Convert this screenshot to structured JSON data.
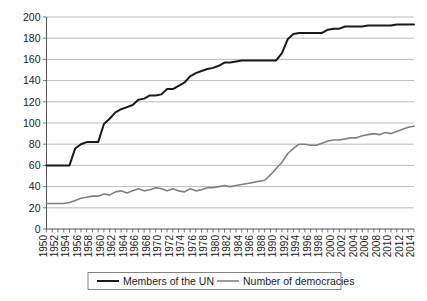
{
  "chart_data": {
    "type": "line",
    "title": "",
    "subtitle": "",
    "xlabel": "",
    "ylabel": "",
    "xlim": [
      1950,
      2014
    ],
    "ylim": [
      0,
      200
    ],
    "grid": "horizontal",
    "legend_position": "bottom",
    "y_ticks": [
      0,
      20,
      40,
      60,
      80,
      100,
      120,
      140,
      160,
      180,
      200
    ],
    "x_tick_labels": [
      "1950",
      "1952",
      "1954",
      "1956",
      "1958",
      "1960",
      "1962",
      "1964",
      "1966",
      "1968",
      "1970",
      "1972",
      "1974",
      "1976",
      "1978",
      "1980",
      "1982",
      "1984",
      "1986",
      "1988",
      "1990",
      "1992",
      "1994",
      "1996",
      "1998",
      "2000",
      "2002",
      "2004",
      "2006",
      "2008",
      "2010",
      "2012",
      "2014"
    ],
    "x": [
      1950,
      1951,
      1952,
      1953,
      1954,
      1955,
      1956,
      1957,
      1958,
      1959,
      1960,
      1961,
      1962,
      1963,
      1964,
      1965,
      1966,
      1967,
      1968,
      1969,
      1970,
      1971,
      1972,
      1973,
      1974,
      1975,
      1976,
      1977,
      1978,
      1979,
      1980,
      1981,
      1982,
      1983,
      1984,
      1985,
      1986,
      1987,
      1988,
      1989,
      1990,
      1991,
      1992,
      1993,
      1994,
      1995,
      1996,
      1997,
      1998,
      1999,
      2000,
      2001,
      2002,
      2003,
      2004,
      2005,
      2006,
      2007,
      2008,
      2009,
      2010,
      2011,
      2012,
      2013,
      2014
    ],
    "series": [
      {
        "name": "Members of the UN",
        "color": "#1a1a1a",
        "line_width": 2.0,
        "values": [
          60,
          60,
          60,
          60,
          60,
          76,
          80,
          82,
          82,
          82,
          99,
          104,
          110,
          113,
          115,
          117,
          122,
          123,
          126,
          126,
          127,
          132,
          132,
          135,
          138,
          144,
          147,
          149,
          151,
          152,
          154,
          157,
          157,
          158,
          159,
          159,
          159,
          159,
          159,
          159,
          159,
          166,
          179,
          184,
          185,
          185,
          185,
          185,
          185,
          188,
          189,
          189,
          191,
          191,
          191,
          191,
          192,
          192,
          192,
          192,
          192,
          193,
          193,
          193,
          193
        ]
      },
      {
        "name": "Number of democracies",
        "color": "#808080",
        "line_width": 1.6,
        "values": [
          24,
          24,
          24,
          24,
          25,
          27,
          29,
          30,
          31,
          31,
          33,
          32,
          35,
          36,
          34,
          36,
          38,
          36,
          37,
          39,
          38,
          36,
          38,
          36,
          35,
          38,
          36,
          37,
          39,
          39,
          40,
          41,
          40,
          41,
          42,
          43,
          44,
          45,
          46,
          51,
          57,
          63,
          71,
          76,
          80,
          80,
          79,
          79,
          81,
          83,
          84,
          84,
          85,
          86,
          86,
          88,
          89,
          90,
          89,
          91,
          90,
          92,
          94,
          96,
          97
        ]
      }
    ]
  },
  "legend": {
    "entries": [
      {
        "label": "Members of the UN",
        "color": "#1a1a1a"
      },
      {
        "label": "Number of democracies",
        "color": "#808080"
      }
    ]
  },
  "axis": {
    "y_axis_name": "count-axis",
    "x_axis_name": "year-axis"
  }
}
